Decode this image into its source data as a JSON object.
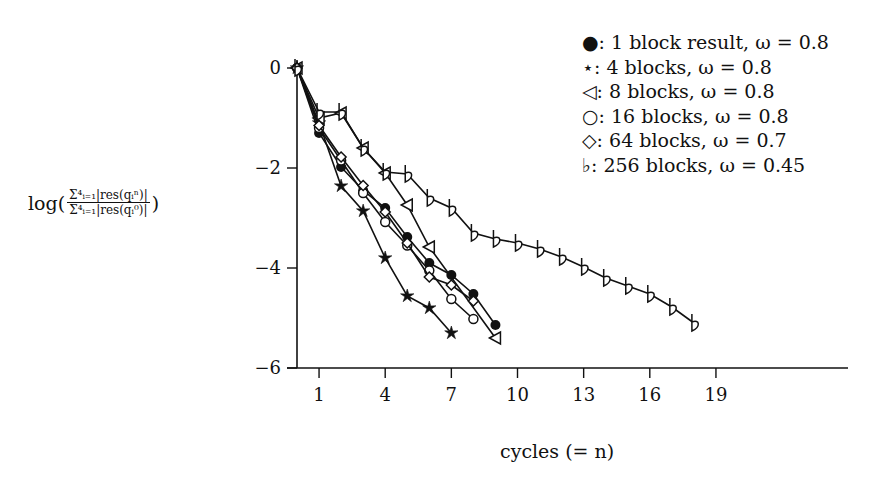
{
  "chart_data": {
    "type": "line",
    "title": "",
    "xlabel": "cycles (= n)",
    "ylabel": "log( Σ_{i=1}^{4}|res(q_i^n)| / Σ_{i=1}^{4}|res(q_i^0)| )",
    "ylabel_parts": {
      "prefix": "log(",
      "numerator": "Σ⁴ᵢ₌₁|res(qᵢⁿ)|",
      "denominator": "Σ⁴ᵢ₌₁|res(qᵢ⁰)|",
      "suffix": ")"
    },
    "x_ticks": [
      1,
      4,
      7,
      10,
      13,
      16,
      19
    ],
    "y_ticks": [
      0,
      -2,
      -4,
      -6
    ],
    "xlim": [
      0,
      23.2
    ],
    "ylim": [
      -6,
      0
    ],
    "grid": false,
    "legend_position": "top-right",
    "series": [
      {
        "name": "1 block result, ω = 0.8",
        "marker": "filled-circle",
        "symbol": "●",
        "x": [
          0,
          1,
          2,
          3,
          4,
          5,
          6,
          7,
          8,
          9
        ],
        "y": [
          0,
          -1.3,
          -1.98,
          -2.45,
          -2.8,
          -3.38,
          -3.9,
          -4.14,
          -4.52,
          -5.14
        ]
      },
      {
        "name": "4 blocks, ω = 0.8",
        "marker": "star",
        "symbol": "⋆",
        "x": [
          0,
          1,
          2,
          3,
          4,
          5,
          6,
          7
        ],
        "y": [
          0,
          -1.1,
          -2.36,
          -2.86,
          -3.8,
          -4.56,
          -4.8,
          -5.3
        ]
      },
      {
        "name": "8 blocks, ω = 0.8",
        "marker": "left-triangle",
        "symbol": "◁",
        "x": [
          0,
          1,
          2,
          3,
          4,
          5,
          6,
          9
        ],
        "y": [
          0,
          -1.0,
          -0.9,
          -1.6,
          -2.1,
          -2.74,
          -3.58,
          -5.4
        ]
      },
      {
        "name": "16 blocks, ω = 0.8",
        "marker": "open-circle",
        "symbol": "○",
        "x": [
          0,
          1,
          2,
          3,
          4,
          5,
          6,
          7,
          8
        ],
        "y": [
          0,
          -1.2,
          -1.85,
          -2.5,
          -3.08,
          -3.55,
          -4.05,
          -4.62,
          -5.02
        ]
      },
      {
        "name": "64 blocks, ω = 0.7",
        "marker": "diamond",
        "symbol": "◇",
        "x": [
          0,
          1,
          2,
          3,
          4,
          5,
          6,
          7,
          8
        ],
        "y": [
          0,
          -1.15,
          -1.78,
          -2.35,
          -2.88,
          -3.5,
          -4.18,
          -4.34,
          -4.66
        ]
      },
      {
        "name": "256 blocks, ω = 0.45",
        "marker": "flat",
        "symbol": "♭",
        "x": [
          0,
          1,
          2,
          3,
          4,
          5,
          6,
          7,
          8,
          9,
          10,
          11,
          12,
          13,
          14,
          15,
          16,
          17,
          18
        ],
        "y": [
          0,
          -0.88,
          -0.88,
          -1.6,
          -2.08,
          -2.12,
          -2.6,
          -2.8,
          -3.3,
          -3.42,
          -3.5,
          -3.62,
          -3.78,
          -3.98,
          -4.2,
          -4.36,
          -4.52,
          -4.78,
          -5.1
        ]
      }
    ]
  },
  "legend": {
    "items": [
      {
        "symbol": "●:",
        "label": "1 block result, ω = 0.8"
      },
      {
        "symbol": "⋆:",
        "label": "4 blocks, ω = 0.8"
      },
      {
        "symbol": "◁:",
        "label": "8 blocks, ω = 0.8"
      },
      {
        "symbol": "○:",
        "label": "16 blocks, ω = 0.8"
      },
      {
        "symbol": "◇:",
        "label": "64 blocks, ω = 0.7"
      },
      {
        "symbol": "♭:",
        "label": "256 blocks, ω = 0.45"
      }
    ]
  },
  "colors": {
    "ink": "#111111",
    "background": "#ffffff"
  }
}
